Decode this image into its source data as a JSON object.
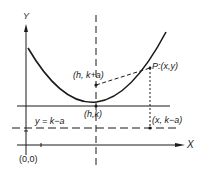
{
  "diagram": {
    "type": "parabola-focus-directrix",
    "colors": {
      "ink": "#1a1a1a",
      "background": "#ffffff"
    },
    "labels": {
      "y_axis": "Y",
      "x_axis": "X",
      "origin": "(0,0)",
      "focus": "(h, k+a)",
      "vertex": "(h,k)",
      "point_p": "P:(x,y)",
      "foot": "(x, k−a)",
      "directrix": "y = k−a"
    },
    "points": {
      "origin": [
        0,
        0
      ],
      "vertex": [
        "h",
        "k"
      ],
      "focus": [
        "h",
        "k+a"
      ],
      "P": [
        "x",
        "y"
      ],
      "foot": [
        "x",
        "k-a"
      ]
    }
  }
}
